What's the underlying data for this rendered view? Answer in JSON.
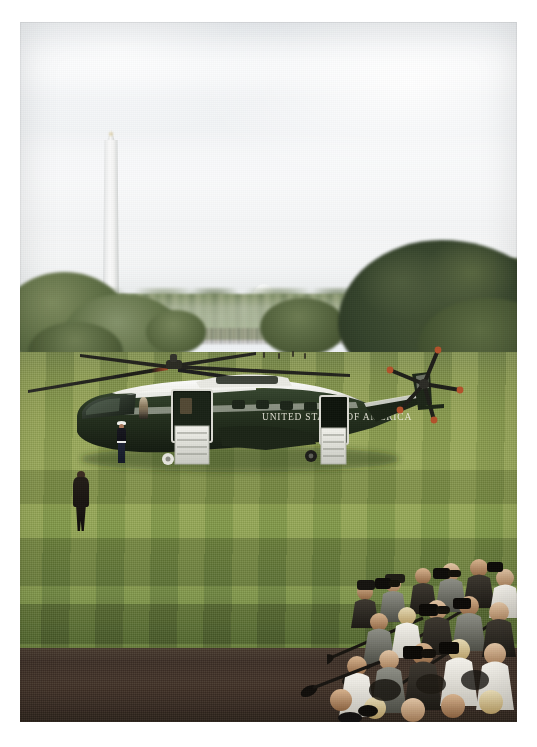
{
  "photograph": {
    "title": "Marine One on the White House South Lawn",
    "orientation": "portrait",
    "frame": {
      "background_color": "#ffffff",
      "left": 20,
      "top": 22,
      "width": 497,
      "height": 700
    }
  },
  "scene": {
    "setting": "White House South Lawn, Washington, D.C.",
    "weather": "overcast, hazy bright sky",
    "sky": {
      "label": "overcast sky",
      "color_top": "#e9edf1",
      "color_mid": "#f7f8f9",
      "color_bottom": "#e3e7e6"
    },
    "lawn": {
      "label": "south lawn",
      "color_light": "#93a455",
      "color_dark": "#5e7536",
      "pattern": "vertical mowing stripes"
    },
    "pavement": {
      "label": "foreground driveway",
      "color": "#3e3027"
    }
  },
  "landmarks": {
    "monument": {
      "name": "Washington Monument",
      "color": "#f3f3f2",
      "description": "obelisk with pyramidion, centered left in the distance"
    },
    "far_dome": {
      "name": "distant white dome structure",
      "color": "#eef0ef"
    },
    "fountain": {
      "name": "south lawn fountain",
      "color": "#f0f2ee"
    },
    "fence": {
      "name": "perimeter fence line",
      "color": "#282d20"
    },
    "far_crowd": {
      "name": "distant spectators along the fence"
    }
  },
  "trees": [
    {
      "name": "tree-left-cluster",
      "color": "#5f6f45"
    },
    {
      "name": "tree-mid-cluster",
      "color": "#56653d"
    },
    {
      "name": "tree-right-large",
      "color": "#33412a"
    },
    {
      "name": "tree-right-cluster",
      "color": "#41502f"
    },
    {
      "name": "tree-line-distant",
      "color": "#6c7d53"
    }
  ],
  "helicopter": {
    "name": "Marine One",
    "model": "Sikorsky VH-3D Sea King",
    "livery_text": "UNITED STATES OF AMERICA",
    "body_color": "#1d2a1f",
    "roof_color": "#f3f3ef",
    "stripe_color": "#e8e9e3",
    "rotor_color": "#20201c",
    "rotor_tip_color": "#b4512a",
    "details": {
      "main_rotor_blades": 5,
      "tail_rotor_blades": 5,
      "doors_open": true,
      "airstairs_deployed": true,
      "state": "parked on the lawn, engines off, doors open"
    }
  },
  "people": {
    "walker": {
      "name": "man in dark suit walking toward helicopter",
      "color": "#16120f"
    },
    "marine_guard": {
      "name": "marine sentry in dress blues at airstairs",
      "cap_color": "#f2f2ee",
      "trouser_color": "#1d2335"
    },
    "attendant": {
      "name": "crew attendant in doorway"
    },
    "press_corps": {
      "name": "press photographers",
      "description": "dense crowd of photographers and reporters with cameras and boom microphones at lower right",
      "approx_count": 34
    }
  },
  "colors": {
    "sky_pale": "#f3f5f7",
    "grass_mid": "#8fa052",
    "grass_shadow": "#5e7536",
    "tree_dark": "#2a3720",
    "pavement_dark": "#3e3027",
    "monument_white": "#f8f8f7",
    "rotor_tip_orange": "#b4512a",
    "page_background": "#ffffff"
  }
}
